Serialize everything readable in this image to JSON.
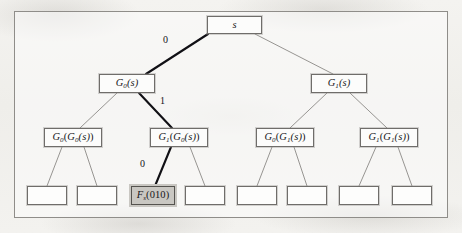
{
  "figure": {
    "background": "#f2f1ee",
    "frame_color": "#8f8d89",
    "node_border_color": "#6f6d6a",
    "node_fill": "#fcfcfb",
    "highlight_fill": "#c9c7c2",
    "edge_color": "#8b8986",
    "path_edge_color": "#111015"
  },
  "tree": {
    "levels": [
      {
        "level": 0,
        "nodes": [
          {
            "id": "root",
            "text": "s",
            "italic": true,
            "highlight": false,
            "x": 207,
            "y": 16,
            "w": 55,
            "h": 18
          }
        ]
      },
      {
        "level": 1,
        "nodes": [
          {
            "id": "g0",
            "text": "G0(s)",
            "label_main": "G",
            "label_sub": "0",
            "label_arg": "(s)",
            "highlight": false,
            "x": 99,
            "y": 74,
            "w": 56,
            "h": 19
          },
          {
            "id": "g1",
            "text": "G1(s)",
            "label_main": "G",
            "label_sub": "1",
            "label_arg": "(s)",
            "highlight": false,
            "x": 311,
            "y": 74,
            "w": 56,
            "h": 19
          }
        ]
      },
      {
        "level": 2,
        "nodes": [
          {
            "id": "g0g0",
            "label_main": "G",
            "label_sub": "0",
            "label_arg": "(G0(s))",
            "inner_main": "G",
            "inner_sub": "0",
            "highlight": false,
            "x": 44,
            "y": 128,
            "w": 58,
            "h": 19
          },
          {
            "id": "g1g0",
            "label_main": "G",
            "label_sub": "1",
            "label_arg": "(G0(s))",
            "inner_main": "G",
            "inner_sub": "0",
            "highlight": false,
            "x": 150,
            "y": 128,
            "w": 58,
            "h": 19
          },
          {
            "id": "g0g1",
            "label_main": "G",
            "label_sub": "0",
            "label_arg": "(G1(s))",
            "inner_main": "G",
            "inner_sub": "1",
            "highlight": false,
            "x": 256,
            "y": 128,
            "w": 58,
            "h": 19
          },
          {
            "id": "g1g1",
            "label_main": "G",
            "label_sub": "1",
            "label_arg": "(G1(s))",
            "inner_main": "G",
            "inner_sub": "1",
            "highlight": false,
            "x": 360,
            "y": 128,
            "w": 58,
            "h": 19
          }
        ]
      },
      {
        "level": 3,
        "nodes": [
          {
            "id": "leaf0",
            "text": "",
            "highlight": false,
            "x": 27,
            "y": 186,
            "w": 40,
            "h": 19
          },
          {
            "id": "leaf1",
            "text": "",
            "highlight": false,
            "x": 77,
            "y": 186,
            "w": 40,
            "h": 19
          },
          {
            "id": "leaf2",
            "text": "Fs(010)",
            "label_main": "F",
            "label_sub": "s",
            "label_arg": "(010)",
            "highlight": true,
            "x": 131,
            "y": 186,
            "w": 44,
            "h": 19
          },
          {
            "id": "leaf3",
            "text": "",
            "highlight": false,
            "x": 185,
            "y": 186,
            "w": 40,
            "h": 19
          },
          {
            "id": "leaf4",
            "text": "",
            "highlight": false,
            "x": 237,
            "y": 186,
            "w": 40,
            "h": 19
          },
          {
            "id": "leaf5",
            "text": "",
            "highlight": false,
            "x": 287,
            "y": 186,
            "w": 40,
            "h": 19
          },
          {
            "id": "leaf6",
            "text": "",
            "highlight": false,
            "x": 339,
            "y": 186,
            "w": 40,
            "h": 19
          },
          {
            "id": "leaf7",
            "text": "",
            "highlight": false,
            "x": 392,
            "y": 186,
            "w": 40,
            "h": 19
          }
        ]
      }
    ],
    "edge_labels": [
      {
        "id": "edge-label-0-root",
        "text": "0",
        "x": 163,
        "y": 40
      },
      {
        "id": "edge-label-1-g0",
        "text": "1",
        "x": 160,
        "y": 101
      },
      {
        "id": "edge-label-0-g1g0",
        "text": "0",
        "x": 140,
        "y": 164
      }
    ],
    "highlighted_path": [
      "root",
      "g0",
      "g1g0",
      "leaf2"
    ],
    "path_string": "010"
  }
}
